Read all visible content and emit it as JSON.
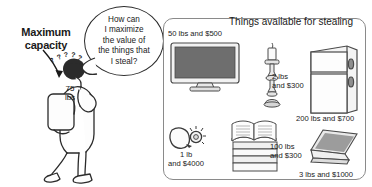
{
  "left": {
    "annotation_label": "Maximum\ncapacity",
    "annotation_line1": "Maximum",
    "annotation_line2": "capacity",
    "thought_bubble": "How can I maximize the value of the things that I steal?",
    "thought_lines": [
      "How can",
      "I maximize",
      "the value of",
      "the things that",
      "I steal?"
    ],
    "backpack_capacity": "75 lbs",
    "backpack_capacity_lines": [
      "75",
      "lbs"
    ],
    "thinking_marks": "?????"
  },
  "panel": {
    "heading": "Things available for stealing",
    "items": [
      {
        "name": "television",
        "icon": "tv-icon",
        "weight": "50 lbs",
        "value": "$500",
        "caption": "50 lbs and $500"
      },
      {
        "name": "candlestick",
        "icon": "candlestick-icon",
        "weight": "2 lbs",
        "value": "$300",
        "caption_line1": "2 lbs",
        "caption_line2": "and $300",
        "caption": "2 lbs and $300"
      },
      {
        "name": "refrigerator",
        "icon": "refrigerator-icon",
        "weight": "200 lbs",
        "value": "$700",
        "caption": "200 lbs and $700"
      },
      {
        "name": "diamond-ring",
        "icon": "ring-icon",
        "weight": "1 lb",
        "value": "$4000",
        "caption_line1": "1 lb",
        "caption_line2": "and $4000",
        "caption": "1 lb and $4000"
      },
      {
        "name": "books",
        "icon": "books-icon",
        "weight": "100 lbs",
        "value": "$300",
        "caption_line1": "100 lbs",
        "caption_line2": "and $300",
        "caption": "100 lbs and $300"
      },
      {
        "name": "laptop",
        "icon": "laptop-icon",
        "weight": "3 lbs",
        "value": "$1000",
        "caption": "3 lbs and $1000"
      }
    ]
  },
  "colors": {
    "background": "#ffffff",
    "ink": "#1a1a1a",
    "panel_border": "#8a8a8a",
    "screen_fill": "#6e6e6e",
    "object_fill": "#f2f2f2",
    "shade": "#cfcfcf"
  }
}
